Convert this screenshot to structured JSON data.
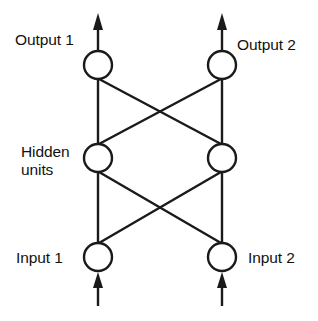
{
  "diagram": {
    "type": "neural-network",
    "background_color": "#ffffff",
    "stroke_color": "#1a1a1a",
    "text_color": "#111111",
    "layers": [
      {
        "id": "output",
        "name": "output-layer",
        "y": 65,
        "nodes": [
          {
            "id": "output-1",
            "label": "Output 1",
            "cx": 98,
            "cy": 65,
            "r": 14
          },
          {
            "id": "output-2",
            "label": "Output 2",
            "cx": 222,
            "cy": 65,
            "r": 14
          }
        ]
      },
      {
        "id": "hidden",
        "name": "hidden-layer",
        "y": 158,
        "label_line_1": "Hidden",
        "label_line_2": "units",
        "nodes": [
          {
            "id": "hidden-1",
            "label": "Hidden unit 1",
            "cx": 98,
            "cy": 158,
            "r": 14
          },
          {
            "id": "hidden-2",
            "label": "Hidden unit 2",
            "cx": 222,
            "cy": 158,
            "r": 14
          }
        ]
      },
      {
        "id": "input",
        "name": "input-layer",
        "y": 257,
        "nodes": [
          {
            "id": "input-1",
            "label": "Input 1",
            "cx": 98,
            "cy": 257,
            "r": 14
          },
          {
            "id": "input-2",
            "label": "Input 2",
            "cx": 222,
            "cy": 257,
            "r": 14
          }
        ]
      }
    ],
    "labels": {
      "output_1": "Output 1",
      "output_2": "Output 2",
      "hidden_line_1": "Hidden",
      "hidden_line_2": "units",
      "input_1": "Input 1",
      "input_2": "Input 2"
    },
    "connections": [
      {
        "from": "input-1",
        "to": "hidden-1",
        "kind": "vertical"
      },
      {
        "from": "input-1",
        "to": "hidden-2",
        "kind": "diagonal"
      },
      {
        "from": "input-2",
        "to": "hidden-1",
        "kind": "diagonal"
      },
      {
        "from": "input-2",
        "to": "hidden-2",
        "kind": "vertical"
      },
      {
        "from": "hidden-1",
        "to": "output-1",
        "kind": "vertical"
      },
      {
        "from": "hidden-1",
        "to": "output-2",
        "kind": "diagonal"
      },
      {
        "from": "hidden-2",
        "to": "output-1",
        "kind": "diagonal"
      },
      {
        "from": "hidden-2",
        "to": "output-2",
        "kind": "vertical"
      }
    ],
    "arrows": [
      {
        "id": "input-arrow-1",
        "direction": "up",
        "from_y": 305,
        "to_y": 277,
        "x": 98
      },
      {
        "id": "input-arrow-2",
        "direction": "up",
        "from_y": 305,
        "to_y": 277,
        "x": 222
      },
      {
        "id": "output-arrow-1",
        "direction": "up",
        "from_y": 51,
        "to_y": 14,
        "x": 98
      },
      {
        "id": "output-arrow-2",
        "direction": "up",
        "from_y": 51,
        "to_y": 14,
        "x": 222
      }
    ]
  }
}
